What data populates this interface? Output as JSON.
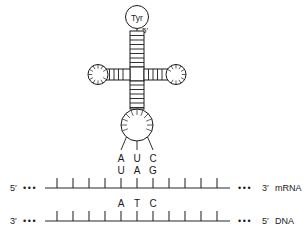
{
  "figure": {
    "amino_acid_label": "Tyr",
    "trna_five_prime_label": "5′",
    "anticodon": {
      "bases": [
        "A",
        "U",
        "C"
      ],
      "description": "tRNA anticodon bases"
    },
    "mrna": {
      "left_end_label": "5′",
      "left_ellipsis": "•••",
      "right_ellipsis": "•••",
      "right_end_label": "3′",
      "name": "mRNA",
      "codon_bases": [
        "U",
        "A",
        "G"
      ],
      "tick_count": 11
    },
    "dna": {
      "left_end_label": "3′",
      "left_ellipsis": "•••",
      "right_ellipsis": "•••",
      "right_end_label": "5′",
      "name": "DNA",
      "triplet_bases": [
        "A",
        "T",
        "C"
      ],
      "tick_count": 11
    },
    "colors": {
      "stroke": "#1a1a1a",
      "strand_line": "#6f6f6f",
      "background": "#ffffff",
      "text": "#1a1a1a"
    }
  }
}
